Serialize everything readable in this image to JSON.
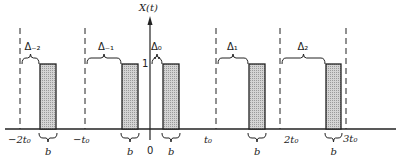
{
  "figure": {
    "y_axis_label": "X(t)",
    "amplitude_label": "1",
    "origin_label": "0",
    "pulse_width_label": "b",
    "colors": {
      "line": "#222222",
      "pulse_fill": "#c8c8c8"
    }
  },
  "ticks": [
    {
      "label": "−2t₀",
      "x": 20
    },
    {
      "label": "−t₀",
      "x": 85
    },
    {
      "label": "t₀",
      "x": 216
    },
    {
      "label": "2t₀",
      "x": 280
    },
    {
      "label": "3t₀",
      "x": 346
    }
  ],
  "pulses": [
    {
      "delta_label": "Δ₋₂",
      "start": 20,
      "x0": 40,
      "x1": 56
    },
    {
      "delta_label": "Δ₋₁",
      "start": 85,
      "x0": 122,
      "x1": 138
    },
    {
      "delta_label": "Δ₀",
      "start": 150,
      "x0": 163,
      "x1": 179
    },
    {
      "delta_label": "Δ₁",
      "start": 216,
      "x0": 249,
      "x1": 265
    },
    {
      "delta_label": "Δ₂",
      "start": 280,
      "x0": 326,
      "x1": 341
    }
  ]
}
